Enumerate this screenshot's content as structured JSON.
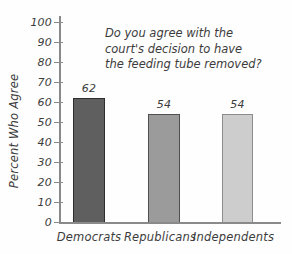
{
  "chart_data": {
    "type": "bar",
    "title": "",
    "question_lines": [
      "Do you agree with the",
      "court's decision to have",
      "the feeding tube removed?"
    ],
    "ylabel": "Percent Who Agree",
    "xlabel": "",
    "categories": [
      "Democrats",
      "Republicans",
      "Independents"
    ],
    "values": [
      62,
      54,
      54
    ],
    "value_labels": [
      "62",
      "54",
      "54"
    ],
    "ylim": [
      0,
      100
    ],
    "ytick_interval": 10,
    "yticks": [
      100,
      90,
      80,
      70,
      60,
      50,
      40,
      30,
      20,
      10,
      0
    ],
    "grid": false,
    "legend_position": "none",
    "bar_fill_colors": [
      "#5f5f5f",
      "#9b9b9b",
      "#cdcdcd"
    ],
    "bar_border_colors": [
      "#2e2e2e",
      "#4f4f4f",
      "#8c8c8c"
    ],
    "axis_color": "#8a8a8a",
    "text_color": "#3c3c3c"
  }
}
